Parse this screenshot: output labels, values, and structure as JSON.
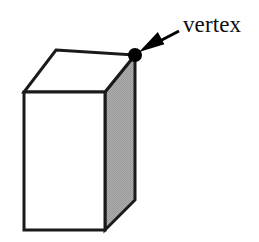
{
  "figure": {
    "title": "vertex",
    "background_color": "#ffffff"
  },
  "annotations": [
    {
      "id": "vertex-callout",
      "label": "vertex",
      "marker": "dot",
      "marker_color": "#000000",
      "marker_point": {
        "x": 135,
        "y": 55
      },
      "arrow": {
        "tail": {
          "x": 179,
          "y": 31
        },
        "tip": {
          "x": 139,
          "y": 52
        },
        "color": "#000000"
      },
      "text_position": {
        "x": 183,
        "y": 13
      },
      "text_color": "#0d0d0d",
      "font_size_px": 23
    }
  ],
  "shape": {
    "name": "rectangular-prism",
    "stroke_color": "#1a1a1a",
    "stroke_width": 3,
    "faces": [
      {
        "name": "top-face",
        "fill": "#ffffff",
        "points": [
          {
            "x": 56,
            "y": 50
          },
          {
            "x": 135,
            "y": 55
          },
          {
            "x": 105,
            "y": 92
          },
          {
            "x": 24,
            "y": 92
          }
        ]
      },
      {
        "name": "front-face",
        "fill": "#ffffff",
        "points": [
          {
            "x": 24,
            "y": 92
          },
          {
            "x": 105,
            "y": 92
          },
          {
            "x": 105,
            "y": 230
          },
          {
            "x": 24,
            "y": 230
          }
        ]
      },
      {
        "name": "right-side-face",
        "fill": "#a9a9a9",
        "points": [
          {
            "x": 105,
            "y": 92
          },
          {
            "x": 135,
            "y": 55
          },
          {
            "x": 135,
            "y": 200
          },
          {
            "x": 105,
            "y": 230
          }
        ]
      }
    ],
    "vertices": {
      "top_back_left": {
        "x": 56,
        "y": 50
      },
      "top_back_right": {
        "x": 135,
        "y": 55
      },
      "top_front_right": {
        "x": 105,
        "y": 92
      },
      "top_front_left": {
        "x": 24,
        "y": 92
      },
      "bottom_front_left": {
        "x": 24,
        "y": 230
      },
      "bottom_front_right": {
        "x": 105,
        "y": 230
      },
      "bottom_back_right": {
        "x": 135,
        "y": 200
      }
    }
  }
}
